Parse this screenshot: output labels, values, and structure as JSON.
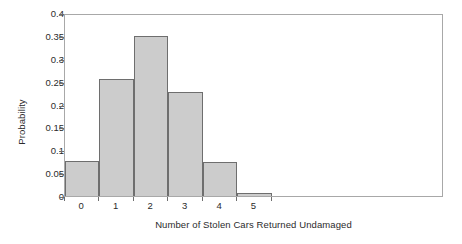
{
  "chart_data": {
    "type": "bar",
    "title": "",
    "xlabel": "Number of Stolen Cars Returned Undamaged",
    "ylabel": "Probability",
    "categories": [
      "0",
      "1",
      "2",
      "3",
      "4",
      "5"
    ],
    "values": [
      0.077,
      0.255,
      0.35,
      0.228,
      0.075,
      0.007
    ],
    "xlim": [
      -0.5,
      10.5
    ],
    "ylim": [
      0,
      0.4
    ],
    "yticks": [
      "0",
      "0.05",
      "0.1",
      "0.15",
      "0.2",
      "0.25",
      "0.3",
      "0.35",
      "0.4"
    ],
    "ytick_values": [
      0,
      0.05,
      0.1,
      0.15,
      0.2,
      0.25,
      0.3,
      0.35,
      0.4
    ],
    "xticks": [
      "0",
      "1",
      "2",
      "3",
      "4",
      "5"
    ],
    "grid": false,
    "legend": false,
    "bar_fill_color": "#cccccc",
    "bar_edge_color": "#6e6e6e",
    "axis_color": "#a8a8a8",
    "background_color": "#ffffff"
  }
}
